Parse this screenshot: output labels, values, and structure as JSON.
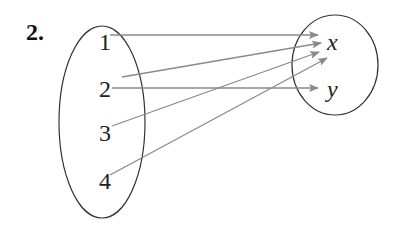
{
  "problem": {
    "label": "2."
  },
  "domain_set": {
    "elements": [
      {
        "text": "1",
        "x": 99,
        "y": 50
      },
      {
        "text": "2",
        "x": 99,
        "y": 97
      },
      {
        "text": "3",
        "x": 99,
        "y": 141
      },
      {
        "text": "4",
        "x": 99,
        "y": 189
      }
    ],
    "ellipse": {
      "cx": 102,
      "cy": 122,
      "rx": 43,
      "ry": 96
    }
  },
  "range_set": {
    "elements": [
      {
        "text": "x",
        "x": 327,
        "y": 50
      },
      {
        "text": "y",
        "x": 327,
        "y": 97
      }
    ],
    "ellipse": {
      "cx": 335,
      "cy": 65,
      "rx": 43,
      "ry": 50
    }
  },
  "mappings": [
    {
      "from": "1",
      "to": "x",
      "x1": 110,
      "y1": 35,
      "x2": 318,
      "y2": 35
    },
    {
      "from": "2",
      "to": "x",
      "x1": 122,
      "y1": 77,
      "x2": 321,
      "y2": 43
    },
    {
      "from": "2",
      "to": "y",
      "x1": 112,
      "y1": 88,
      "x2": 318,
      "y2": 88
    },
    {
      "from": "3",
      "to": "x",
      "x1": 112,
      "y1": 126,
      "x2": 319,
      "y2": 52
    },
    {
      "from": "4",
      "to": "x",
      "x1": 110,
      "y1": 175,
      "x2": 327,
      "y2": 58
    }
  ],
  "colors": {
    "arrow": "#8a8a8a",
    "ellipse": "#333333",
    "text": "#222222"
  }
}
